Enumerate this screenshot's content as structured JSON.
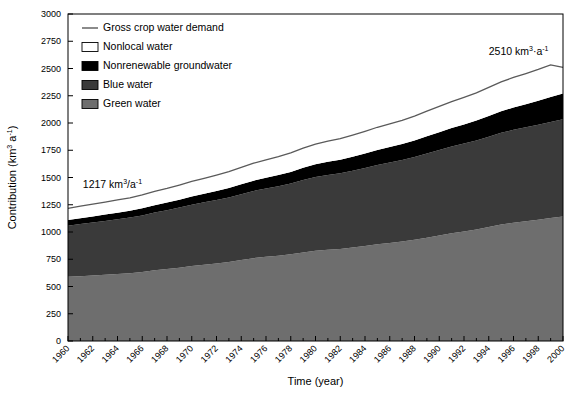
{
  "chart_data": {
    "type": "area",
    "title": "",
    "xlabel": "Time (year)",
    "ylabel": "Contribution (km3 a-1)",
    "ylabel_parts": {
      "main": "Contribution (km",
      "sup1": "3",
      "mid": " a",
      "sup2": "-1",
      "close": ")"
    },
    "xlim": [
      1960,
      2000
    ],
    "ylim": [
      0,
      3000
    ],
    "ytick_step": 250,
    "xtick_step": 2,
    "grid": false,
    "legend_position": "top-left-inside",
    "stacked": true,
    "yticks": [
      "0",
      "250",
      "500",
      "750",
      "1000",
      "1250",
      "1500",
      "1750",
      "2000",
      "2250",
      "2500",
      "2750",
      "3000"
    ],
    "xticks": [
      "1960",
      "1962",
      "1964",
      "1966",
      "1968",
      "1970",
      "1972",
      "1974",
      "1976",
      "1978",
      "1980",
      "1982",
      "1984",
      "1986",
      "1988",
      "1990",
      "1992",
      "1994",
      "1996",
      "1998",
      "2000"
    ],
    "x": [
      1960,
      1961,
      1962,
      1963,
      1964,
      1965,
      1966,
      1967,
      1968,
      1969,
      1970,
      1971,
      1972,
      1973,
      1974,
      1975,
      1976,
      1977,
      1978,
      1979,
      1980,
      1981,
      1982,
      1983,
      1984,
      1985,
      1986,
      1987,
      1988,
      1989,
      1990,
      1991,
      1992,
      1993,
      1994,
      1995,
      1996,
      1997,
      1998,
      1999,
      2000
    ],
    "series": [
      {
        "name": "Green water",
        "color": "#6e6e6e",
        "values": [
          590,
          595,
          600,
          608,
          615,
          622,
          632,
          648,
          660,
          672,
          688,
          700,
          712,
          725,
          742,
          760,
          772,
          782,
          795,
          812,
          828,
          838,
          845,
          858,
          872,
          888,
          900,
          912,
          928,
          948,
          968,
          988,
          1005,
          1022,
          1045,
          1068,
          1085,
          1098,
          1112,
          1128,
          1142
        ]
      },
      {
        "name": "Blue water",
        "color": "#3a3a3a",
        "values": [
          468,
          478,
          487,
          494,
          502,
          510,
          520,
          530,
          540,
          552,
          562,
          572,
          582,
          592,
          605,
          617,
          627,
          638,
          650,
          665,
          676,
          686,
          694,
          705,
          716,
          727,
          737,
          748,
          760,
          772,
          784,
          796,
          806,
          818,
          830,
          842,
          852,
          862,
          872,
          882,
          892
        ]
      },
      {
        "name": "Nonrenewable groundwater",
        "color": "#000000",
        "values": [
          52,
          54,
          56,
          58,
          60,
          62,
          65,
          68,
          70,
          73,
          76,
          79,
          82,
          86,
          90,
          94,
          98,
          102,
          106,
          112,
          117,
          120,
          124,
          128,
          133,
          138,
          142,
          147,
          152,
          158,
          164,
          170,
          176,
          182,
          190,
          198,
          205,
          212,
          220,
          228,
          236
        ]
      },
      {
        "name": "Nonlocal water",
        "color": "#ffffff",
        "values": [
          107,
          110,
          112,
          114,
          117,
          120,
          123,
          127,
          130,
          134,
          138,
          142,
          146,
          150,
          155,
          160,
          165,
          169,
          174,
          180,
          185,
          189,
          193,
          198,
          203,
          208,
          213,
          218,
          224,
          230,
          236,
          242,
          248,
          254,
          262,
          269,
          276,
          282,
          288,
          295,
          240
        ]
      }
    ],
    "line_series": {
      "name": "Gross crop water demand",
      "color": "#5a5a5a",
      "values": [
        1217,
        1237,
        1255,
        1274,
        1294,
        1314,
        1340,
        1373,
        1400,
        1431,
        1464,
        1493,
        1522,
        1553,
        1592,
        1631,
        1662,
        1691,
        1725,
        1769,
        1806,
        1833,
        1856,
        1889,
        1924,
        1961,
        1992,
        2025,
        2064,
        2108,
        2152,
        2196,
        2235,
        2276,
        2327,
        2377,
        2418,
        2454,
        2492,
        2533,
        2510
      ]
    },
    "annotations": [
      {
        "name": "start-value",
        "text": "1217 km3/a-1",
        "parts": {
          "num": "1217 km",
          "sup1": "3",
          "mid": "/a",
          "sup2": "-1"
        },
        "x": 1961.2,
        "y": 1400
      },
      {
        "name": "end-value",
        "text": "2510 km3·a-1",
        "parts": {
          "num": "2510 km",
          "sup1": "3",
          "mid": "·a",
          "sup2": "-1"
        },
        "x": 1994.0,
        "y": 2620
      }
    ],
    "legend": [
      {
        "label": "Gross crop water demand",
        "marker": "line",
        "color": "#5a5a5a"
      },
      {
        "label": "Nonlocal water",
        "marker": "box",
        "color": "#ffffff"
      },
      {
        "label": "Nonrenewable groundwater",
        "marker": "box",
        "color": "#000000"
      },
      {
        "label": "Blue water",
        "marker": "box",
        "color": "#3a3a3a"
      },
      {
        "label": "Green water",
        "marker": "box",
        "color": "#6e6e6e"
      }
    ]
  }
}
